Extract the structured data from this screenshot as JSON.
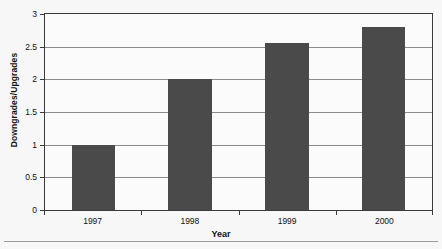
{
  "chart_data": {
    "type": "bar",
    "title": "",
    "categories": [
      "1997",
      "1998",
      "1999",
      "2000"
    ],
    "values": [
      1.0,
      2.0,
      2.55,
      2.8
    ],
    "series": [
      {
        "name": "Downgrades/Upgrades",
        "values": [
          1.0,
          2.0,
          2.55,
          2.8
        ]
      }
    ],
    "xlabel": "Year",
    "ylabel": "Downgrades/Upgrades",
    "ylim": [
      0,
      3
    ],
    "yticks": [
      0,
      0.5,
      1,
      1.5,
      2,
      2.5,
      3
    ],
    "ytick_labels": [
      "0",
      "0.5",
      "1",
      "1.5",
      "2",
      "2.5",
      "3"
    ],
    "grid": true,
    "legend": false,
    "legend_position": "none",
    "bar_color": "#4a4a4a",
    "grid_color": "#8a8a8a",
    "axis_color": "#3a3a3a",
    "background_color": "#f7f7f7",
    "plot_background_color": "#fbfbfb"
  }
}
